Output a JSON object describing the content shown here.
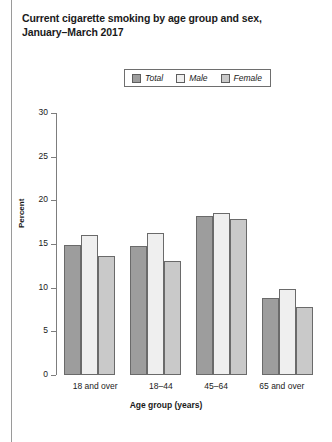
{
  "page": {
    "figure_name": "current-cigarette-smoking-by-age-group-and-sex"
  },
  "title": {
    "line1": "Current cigarette smoking by age group and sex,",
    "line2": "January–March 2017"
  },
  "chart_data": {
    "type": "bar",
    "title": "Current cigarette smoking by age group and sex, January–March 2017",
    "xlabel": "Age group (years)",
    "ylabel": "Percent",
    "ylim": [
      0,
      30
    ],
    "yticks": [
      0,
      5,
      10,
      15,
      20,
      25,
      30
    ],
    "grid": false,
    "legend_position": "top-center",
    "categories": [
      "18 and over",
      "18–44",
      "45–64",
      "65 and over"
    ],
    "series": [
      {
        "name": "Total",
        "color": "#9d9d9d",
        "values": [
          14.9,
          14.8,
          18.2,
          8.8
        ]
      },
      {
        "name": "Male",
        "color": "#efefef",
        "values": [
          16.0,
          16.3,
          18.5,
          9.9
        ]
      },
      {
        "name": "Female",
        "color": "#c9c9c9",
        "values": [
          13.6,
          13.1,
          17.9,
          7.8
        ]
      }
    ]
  }
}
